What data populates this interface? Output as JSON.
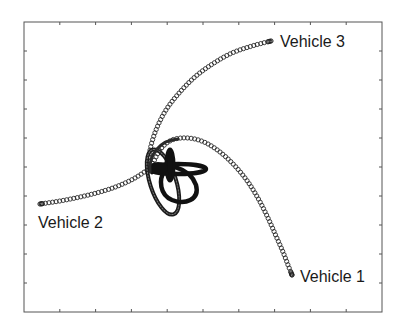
{
  "chart_data": {
    "type": "scatter",
    "title": "",
    "xlabel": "",
    "ylabel": "",
    "grid": false,
    "legend": null,
    "frame_px": {
      "left": 24,
      "top": 22,
      "right": 382,
      "bottom": 312
    },
    "x_ticks_count": 9,
    "y_ticks_count": 9,
    "tick_labels_visible": false,
    "marker": "open-circle",
    "series": [
      {
        "name": "Vehicle 1",
        "label": "Vehicle 1",
        "description": "Starts in central tangle, arcs up-right then descends to lower right",
        "points_px": [
          [
            150,
            170
          ],
          [
            160,
            150
          ],
          [
            172,
            140
          ],
          [
            188,
            138
          ],
          [
            204,
            142
          ],
          [
            220,
            152
          ],
          [
            235,
            166
          ],
          [
            248,
            182
          ],
          [
            259,
            200
          ],
          [
            268,
            218
          ],
          [
            276,
            236
          ],
          [
            283,
            252
          ],
          [
            288,
            265
          ],
          [
            292,
            275
          ]
        ],
        "endpoint_px": [
          292,
          275
        ]
      },
      {
        "name": "Vehicle 2",
        "label": "Vehicle 2",
        "description": "Starts in central tangle, extends left nearly horizontally",
        "points_px": [
          [
            150,
            168
          ],
          [
            135,
            178
          ],
          [
            118,
            186
          ],
          [
            100,
            192
          ],
          [
            80,
            197
          ],
          [
            60,
            201
          ],
          [
            40,
            204
          ]
        ],
        "endpoint_px": [
          40,
          204
        ]
      },
      {
        "name": "Vehicle 3",
        "label": "Vehicle 3",
        "description": "Starts in central tangle, arcs up and right to upper right",
        "points_px": [
          [
            148,
            168
          ],
          [
            150,
            150
          ],
          [
            156,
            130
          ],
          [
            166,
            110
          ],
          [
            180,
            92
          ],
          [
            196,
            76
          ],
          [
            214,
            63
          ],
          [
            232,
            53
          ],
          [
            252,
            46
          ],
          [
            271,
            41
          ]
        ],
        "endpoint_px": [
          271,
          41
        ]
      }
    ],
    "annotations": [
      {
        "text": "Vehicle 3",
        "x_px": 280,
        "y_px": 34
      },
      {
        "text": "Vehicle 2",
        "x_px": 38,
        "y_px": 215
      },
      {
        "text": "Vehicle 1",
        "x_px": 300,
        "y_px": 269
      }
    ]
  },
  "labels": {
    "vehicle1": "Vehicle 1",
    "vehicle2": "Vehicle 2",
    "vehicle3": "Vehicle 3"
  },
  "colors": {
    "marker_stroke": "#2a2a2a",
    "tangle": "#111111",
    "axes": "#555555",
    "background": "#ffffff"
  }
}
